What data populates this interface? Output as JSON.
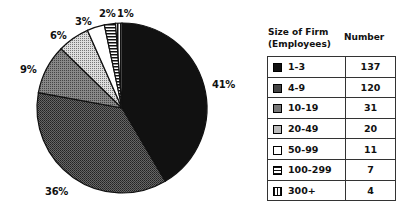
{
  "chart_data": {
    "type": "pie",
    "title": "",
    "legend_header": [
      "Size of Firm (Employees)",
      "Number"
    ],
    "categories": [
      "1-3",
      "4-9",
      "10-19",
      "20-49",
      "50-99",
      "100-299",
      "300+"
    ],
    "values": [
      137,
      120,
      31,
      20,
      11,
      7,
      4
    ],
    "percent_labels": [
      "41%",
      "36%",
      "9%",
      "6%",
      "3%",
      "2%",
      "1%"
    ],
    "legend_position": "right"
  },
  "legend": {
    "header_col1_line1": "Size of Firm",
    "header_col1_line2": "(Employees)",
    "header_col2": "Number",
    "rows": [
      {
        "label": "1-3",
        "value": "137"
      },
      {
        "label": "4-9",
        "value": "120"
      },
      {
        "label": "10-19",
        "value": "31"
      },
      {
        "label": "20-49",
        "value": "20"
      },
      {
        "label": "50-99",
        "value": "11"
      },
      {
        "label": "100-299",
        "value": "7"
      },
      {
        "label": "300+",
        "value": "4"
      }
    ]
  },
  "labels": [
    "41%",
    "36%",
    "9%",
    "6%",
    "3%",
    "2%",
    "1%"
  ]
}
